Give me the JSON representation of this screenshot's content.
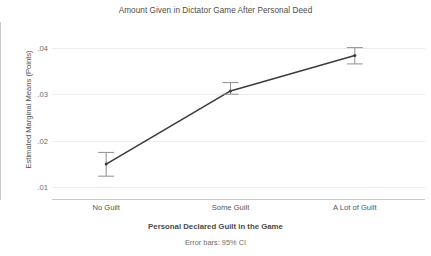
{
  "chart_data": {
    "type": "line",
    "title": "Amount Given in Dictator Game After Personal Deed",
    "xlabel": "Personal Declared Guilt in the Game",
    "ylabel": "Estimated Marginal Means (Points)",
    "caption": "Error bars: 95% CI",
    "categories": [
      "No Guilt",
      "Some Guilt",
      "A Lot of Guilt"
    ],
    "values": [
      0.015,
      0.0307,
      0.0383
    ],
    "error_low": [
      0.0124,
      0.03,
      0.0365
    ],
    "error_high": [
      0.0175,
      0.0325,
      0.04
    ],
    "ylim": [
      0.0075,
      0.0455
    ],
    "yticks": [
      0.01,
      0.02,
      0.03,
      0.04
    ],
    "ytick_labels": [
      ".01",
      ".02",
      ".03",
      ".04"
    ],
    "grid": true,
    "legend": "none",
    "series": [
      {
        "name": "Estimated Marginal Means",
        "values": [
          0.015,
          0.0307,
          0.0383
        ]
      }
    ],
    "colors": {
      "line": "#3c3c3c",
      "errorbar": "#8a8a8a",
      "grid": "#ededed",
      "axis": "#c9c9c9",
      "background": "#ffffff",
      "text": "#4a4a4a"
    }
  }
}
